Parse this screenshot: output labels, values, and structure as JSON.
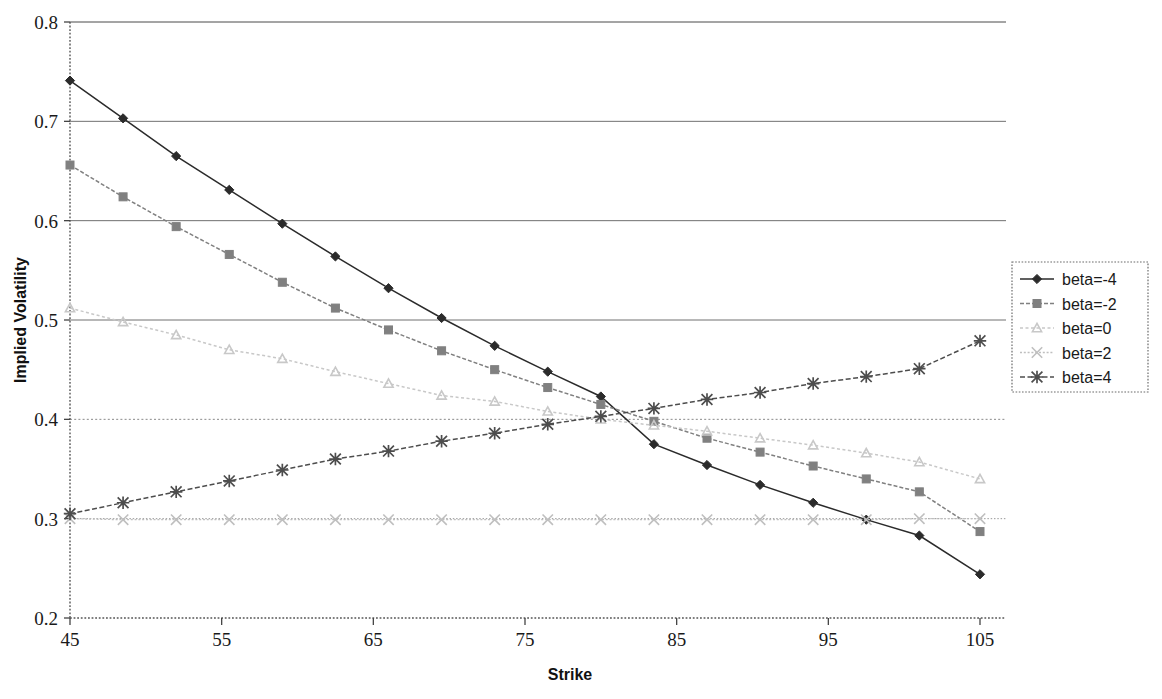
{
  "chart_data": {
    "type": "line",
    "title": "",
    "xlabel": "Strike",
    "ylabel": "Implied Volatility",
    "xlim": [
      45,
      105
    ],
    "ylim": [
      0.2,
      0.8
    ],
    "x_ticks": [
      45,
      55,
      65,
      75,
      85,
      95,
      105
    ],
    "y_ticks": [
      0.2,
      0.3,
      0.4,
      0.5,
      0.6,
      0.7,
      0.8
    ],
    "grid": true,
    "legend_position": "right",
    "x": [
      45,
      48.5,
      52,
      55.5,
      59,
      62.5,
      66,
      69.5,
      73,
      76.5,
      80,
      83.5,
      87,
      90.5,
      94,
      97.5,
      101,
      105
    ],
    "series": [
      {
        "name": "beta=-4",
        "marker": "diamond",
        "color": "#2b2b2b",
        "values": [
          0.741,
          0.703,
          0.665,
          0.631,
          0.597,
          0.564,
          0.532,
          0.502,
          0.474,
          0.448,
          0.423,
          0.375,
          0.354,
          0.334,
          0.316,
          0.299,
          0.283,
          0.244
        ]
      },
      {
        "name": "beta=-2",
        "marker": "square",
        "color": "#808080",
        "values": [
          0.656,
          0.624,
          0.594,
          0.566,
          0.538,
          0.512,
          0.49,
          0.469,
          0.45,
          0.432,
          0.415,
          0.398,
          0.381,
          0.367,
          0.353,
          0.34,
          0.327,
          0.287
        ]
      },
      {
        "name": "beta=0",
        "marker": "triangle",
        "color": "#c8c8c8",
        "values": [
          0.512,
          0.498,
          0.485,
          0.47,
          0.461,
          0.448,
          0.436,
          0.424,
          0.418,
          0.408,
          0.4,
          0.394,
          0.388,
          0.381,
          0.374,
          0.366,
          0.357,
          0.34
        ]
      },
      {
        "name": "beta=2",
        "marker": "cross-x",
        "color": "#bfbfbf",
        "values": [
          0.3,
          0.299,
          0.299,
          0.299,
          0.299,
          0.299,
          0.299,
          0.299,
          0.299,
          0.299,
          0.299,
          0.299,
          0.299,
          0.299,
          0.299,
          0.299,
          0.3,
          0.3
        ]
      },
      {
        "name": "beta=4",
        "marker": "star",
        "color": "#4d4d4d",
        "values": [
          0.305,
          0.316,
          0.327,
          0.338,
          0.349,
          0.36,
          0.368,
          0.378,
          0.386,
          0.395,
          0.403,
          0.411,
          0.42,
          0.427,
          0.436,
          0.443,
          0.451,
          0.479
        ]
      }
    ],
    "series_right_edge": {
      "beta=-4": 0.244,
      "beta=-2": 0.287,
      "beta=0": 0.34,
      "beta=2": 0.3,
      "beta=4": 0.479
    },
    "crossing_point": {
      "x": 77,
      "y": 0.4
    },
    "annotations": []
  },
  "axes": {
    "x_title": "Strike",
    "y_title": "Implied Volatility",
    "x_tick_labels": [
      "45",
      "55",
      "65",
      "75",
      "85",
      "95",
      "105"
    ],
    "y_tick_labels": [
      "0.2",
      "0.3",
      "0.4",
      "0.5",
      "0.6",
      "0.7",
      "0.8"
    ]
  },
  "legend": {
    "entries": [
      {
        "label": "beta=-4"
      },
      {
        "label": "beta=-2"
      },
      {
        "label": "beta=0"
      },
      {
        "label": "beta=2"
      },
      {
        "label": "beta=4"
      }
    ]
  },
  "colors": {
    "background": "#ffffff",
    "axis": "#4a4a4a",
    "grid_dark": "#6b6b6b",
    "grid_light": "#9a9a9a",
    "text": "#1a1a1a"
  }
}
